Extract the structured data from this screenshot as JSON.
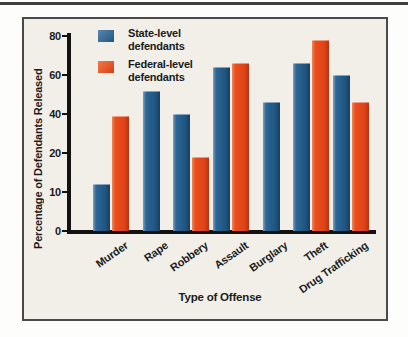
{
  "figure": {
    "legend": [
      {
        "series": "state",
        "line1": "State-level",
        "line2": "defendants",
        "color": "#26608f"
      },
      {
        "series": "federal",
        "line1": "Federal-level",
        "line2": "defendants",
        "color": "#e94e1b"
      }
    ]
  },
  "chart_data": {
    "type": "bar",
    "title": "",
    "xlabel": "Type of Offense",
    "ylabel": "Percentage of Defendants Released",
    "y_ticks": [
      0,
      10,
      20,
      40,
      60,
      80
    ],
    "axis_note_as_printed": "tick labels 0,10,20,40,60,80 are equally spaced on the printed axis",
    "grid": "off",
    "legend_position": "top-left inside plot",
    "categories": [
      "Murder",
      "Rape",
      "Robbery",
      "Assault",
      "Burglary",
      "Theft",
      "Drug Trafficking"
    ],
    "series": [
      {
        "name": "State-level defendants",
        "color": "#26608f",
        "values": [
          12,
          52,
          40,
          64,
          46,
          66,
          60
        ]
      },
      {
        "name": "Federal-level defendants",
        "color": "#e94e1b",
        "values": [
          39,
          null,
          19,
          66,
          null,
          78,
          46
        ]
      }
    ]
  }
}
